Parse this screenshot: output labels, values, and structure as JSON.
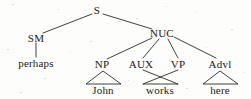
{
  "figure": {
    "type": "syntax-tree-diagram",
    "background_color": "#fdfdfb",
    "line_color": "#2b2b2b",
    "text_color": "#1a1a1a",
    "width": 251,
    "height": 99
  },
  "nodes": {
    "s": {
      "label": "S",
      "x": 97,
      "y": 10
    },
    "sm": {
      "label": "SM",
      "x": 36,
      "y": 38
    },
    "nuc": {
      "label": "NUC",
      "x": 162,
      "y": 33
    },
    "np": {
      "label": "NP",
      "x": 102,
      "y": 64
    },
    "aux": {
      "label": "AUX",
      "x": 141,
      "y": 64
    },
    "vp": {
      "label": "VP",
      "x": 178,
      "y": 64
    },
    "advl": {
      "label": "Advl",
      "x": 220,
      "y": 64
    }
  },
  "words": {
    "perhaps": {
      "label": "perhaps",
      "x": 36,
      "y": 63
    },
    "john": {
      "label": "John",
      "x": 103,
      "y": 90
    },
    "works": {
      "label": "works",
      "x": 160,
      "y": 90
    },
    "here": {
      "label": "here",
      "x": 220,
      "y": 90
    }
  },
  "edges": [
    {
      "name": "s-to-sm",
      "from": "S",
      "to": "SM",
      "style": "line"
    },
    {
      "name": "s-to-nuc",
      "from": "S",
      "to": "NUC",
      "style": "line"
    },
    {
      "name": "sm-to-perhaps",
      "from": "SM",
      "to": "perhaps",
      "style": "line"
    },
    {
      "name": "nuc-to-np",
      "from": "NUC",
      "to": "NP",
      "style": "line"
    },
    {
      "name": "nuc-to-aux",
      "from": "NUC",
      "to": "AUX",
      "style": "line"
    },
    {
      "name": "nuc-to-vp",
      "from": "NUC",
      "to": "VP",
      "style": "line"
    },
    {
      "name": "nuc-to-advl",
      "from": "NUC",
      "to": "Advl",
      "style": "line"
    },
    {
      "name": "aux-to-works",
      "from": "AUX",
      "to": "works",
      "style": "crossing-line"
    },
    {
      "name": "vp-to-works",
      "from": "VP",
      "to": "works",
      "style": "crossing-line"
    }
  ],
  "triangles": [
    {
      "name": "np-triangle",
      "dominates": "John",
      "apex_x": 103,
      "apex_y": 71,
      "left_x": 86,
      "right_x": 121,
      "base_y": 84
    },
    {
      "name": "works-triangle",
      "dominates": "works",
      "apex_x": 160,
      "apex_y": 71,
      "left_x": 143,
      "right_x": 178,
      "base_y": 84
    },
    {
      "name": "advl-triangle",
      "dominates": "here",
      "apex_x": 220,
      "apex_y": 71,
      "left_x": 203,
      "right_x": 238,
      "base_y": 84
    }
  ]
}
